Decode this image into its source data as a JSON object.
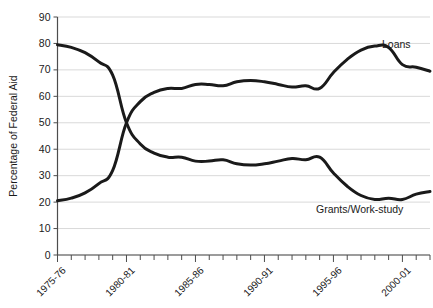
{
  "chart_data": {
    "type": "line",
    "title": "",
    "subtitle": "",
    "xlabel": "",
    "ylabel": "Percentage of Federal Aid",
    "ylim": [
      0,
      90
    ],
    "ytick_labels": [
      "0",
      "10",
      "20",
      "30",
      "40",
      "50",
      "60",
      "70",
      "80",
      "90"
    ],
    "ytick_values": [
      0,
      10,
      20,
      30,
      40,
      50,
      60,
      70,
      80,
      90
    ],
    "grid": "horizontal",
    "legend_position": "inline-right",
    "x": [
      "1975-76",
      "1976-77",
      "1977-78",
      "1978-79",
      "1979-80",
      "1980-81",
      "1981-82",
      "1982-83",
      "1983-84",
      "1984-85",
      "1985-86",
      "1986-87",
      "1987-88",
      "1988-89",
      "1989-90",
      "1990-91",
      "1991-92",
      "1992-93",
      "1993-94",
      "1994-95",
      "1995-96",
      "1996-97",
      "1997-98",
      "1998-99",
      "1999-00",
      "2000-01",
      "2001-02",
      "2002-03"
    ],
    "xtick_labels": [
      "1975-76",
      "1980-81",
      "1985-86",
      "1990-91",
      "1995-96",
      "2000-01"
    ],
    "xtick_indices": [
      0,
      5,
      10,
      15,
      20,
      25
    ],
    "series": [
      {
        "name": "Loans",
        "color": "#1a1a1a",
        "values": [
          20.5,
          21.5,
          23.5,
          27.0,
          32.0,
          50.0,
          58.0,
          61.5,
          63.0,
          63.0,
          64.5,
          64.5,
          64.0,
          65.5,
          66.0,
          65.5,
          64.5,
          63.5,
          64.0,
          63.0,
          69.0,
          74.0,
          77.5,
          79.0,
          78.5,
          72.0,
          71.0,
          69.5
        ]
      },
      {
        "name": "Grants/Work-study",
        "color": "#1a1a1a",
        "values": [
          79.5,
          78.5,
          76.5,
          73.0,
          68.0,
          50.0,
          42.0,
          38.5,
          37.0,
          37.0,
          35.5,
          35.5,
          36.0,
          34.5,
          34.0,
          34.5,
          35.5,
          36.5,
          36.0,
          37.0,
          31.0,
          26.0,
          22.5,
          21.0,
          21.5,
          21.0,
          23.0,
          24.0
        ]
      }
    ],
    "annotations": [
      {
        "text": "Loans",
        "series": "Loans",
        "x_px": 382,
        "y_px": 48
      },
      {
        "text": "Grants/Work-study",
        "series": "Grants/Work-study",
        "x_px": 316,
        "y_px": 213
      }
    ]
  }
}
